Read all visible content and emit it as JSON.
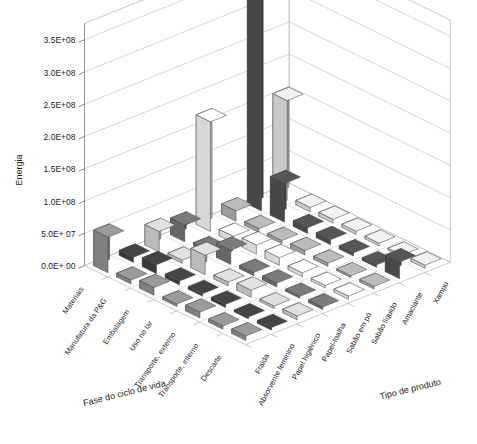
{
  "chart_data": {
    "type": "bar",
    "subtype": "3d-column",
    "title": "",
    "xlabel": "Fase do ciclo de vida",
    "ylabel": "Energia",
    "zlabel": "Tipo de produto",
    "ylim": [
      0,
      375000000
    ],
    "ytick_labels": [
      "0.0E+ 00",
      "5.0E+ 07",
      "1.0E+08",
      "1.5E+08",
      "2.0E+08",
      "2.5E+08",
      "3.0E+08",
      "3.5E+08"
    ],
    "ytick_values": [
      0,
      50000000,
      100000000,
      150000000,
      200000000,
      250000000,
      300000000,
      350000000
    ],
    "grid": true,
    "legend": "none",
    "categories": [
      "Materiais",
      "Manufatura da P&G",
      "Embalagem",
      "Uso no lar",
      "Transporte, externo",
      "Transporte, interno",
      "Descarte"
    ],
    "series": [
      {
        "name": "Fralda",
        "values": [
          55000000,
          6000000,
          12000000,
          4000000,
          9000000,
          5000000,
          7000000
        ]
      },
      {
        "name": "Absorvente feminino",
        "values": [
          8000000,
          14000000,
          6000000,
          4000000,
          5000000,
          3000000,
          4000000
        ]
      },
      {
        "name": "Papel higiênico",
        "values": [
          32000000,
          5000000,
          30000000,
          6000000,
          11000000,
          4000000,
          6000000
        ]
      },
      {
        "name": "Papel-toalha",
        "values": [
          26000000,
          5000000,
          22000000,
          5000000,
          6000000,
          3000000,
          4000000
        ]
      },
      {
        "name": "Sabão em pó",
        "values": [
          170000000,
          10000000,
          14000000,
          12000000,
          6000000,
          4000000,
          5000000
        ]
      },
      {
        "name": "Sabão líquido",
        "values": [
          16000000,
          6000000,
          5000000,
          7000000,
          5000000,
          3000000,
          4000000
        ]
      },
      {
        "name": "Amaciante",
        "values": [
          355000000,
          60000000,
          9000000,
          8000000,
          5000000,
          4000000,
          26000000
        ]
      },
      {
        "name": "Xampu",
        "values": [
          155000000,
          7000000,
          6000000,
          5000000,
          4000000,
          3000000,
          5000000
        ]
      }
    ],
    "series_colors": [
      "#8a8a8a",
      "#3d3d3d",
      "#c9c9c9",
      "#6e6e6e",
      "#e8e8e8",
      "#a8a8a8",
      "#4d4d4d",
      "#d8d8d8"
    ],
    "tallest_bar": {
      "category": "Materiais",
      "series": "Amaciante",
      "value": 355000000
    }
  },
  "axis": {
    "y_title": "Energia",
    "x_title": "Fase do ciclo de vida",
    "z_title": "Tipo de produto"
  }
}
